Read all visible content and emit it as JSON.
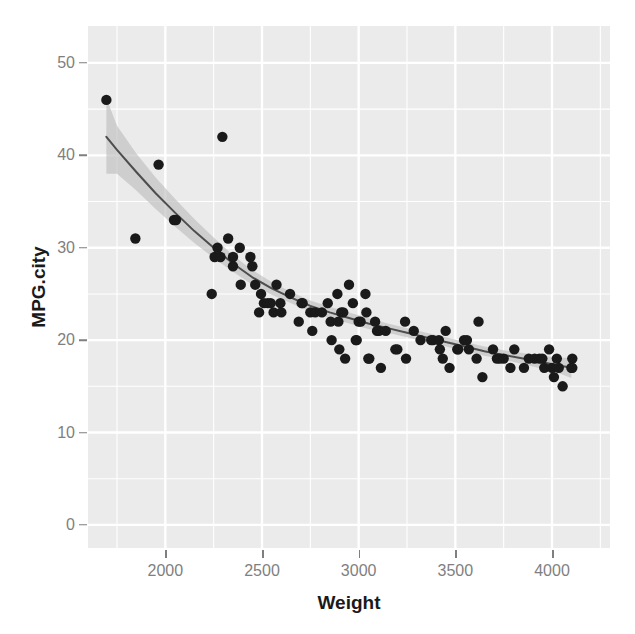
{
  "chart_data": {
    "type": "scatter",
    "title": "",
    "subtitle": "",
    "xlabel": "Weight",
    "ylabel": "MPG.city",
    "xlim": [
      1600,
      4300
    ],
    "ylim": [
      -2.5,
      54
    ],
    "grid": true,
    "legend": null,
    "xticks": [
      2000,
      2500,
      3000,
      3500,
      4000
    ],
    "xtick_labels": [
      "2000",
      "2500",
      "3000",
      "3500",
      "4000"
    ],
    "yticks": [
      0,
      10,
      20,
      30,
      40,
      50
    ],
    "ytick_labels": [
      "0",
      "10",
      "20",
      "30",
      "40",
      "50"
    ],
    "minor_xticks": [
      1750,
      2250,
      2750,
      3250,
      3750,
      4250
    ],
    "minor_yticks": [
      5,
      15,
      25,
      35,
      45
    ],
    "point_color": "#1a1a1a",
    "point_size": 5.2,
    "panel_background": "#ebebeb",
    "grid_color": "#ffffff",
    "smoother": {
      "name": "loess",
      "line_color": "#4d4d4d",
      "band_color": "#bfbfbf",
      "band_opacity": 0.65,
      "fit": [
        {
          "x": 1695,
          "y": 42.0,
          "lo": 38.0,
          "hi": 46.2
        },
        {
          "x": 1750,
          "y": 40.6,
          "lo": 38.0,
          "hi": 43.2
        },
        {
          "x": 1850,
          "y": 38.2,
          "lo": 36.2,
          "hi": 40.2
        },
        {
          "x": 1950,
          "y": 35.9,
          "lo": 34.2,
          "hi": 37.6
        },
        {
          "x": 2050,
          "y": 33.8,
          "lo": 32.3,
          "hi": 35.3
        },
        {
          "x": 2150,
          "y": 31.8,
          "lo": 30.5,
          "hi": 33.1
        },
        {
          "x": 2250,
          "y": 30.0,
          "lo": 28.9,
          "hi": 31.1
        },
        {
          "x": 2350,
          "y": 28.3,
          "lo": 27.4,
          "hi": 29.2
        },
        {
          "x": 2450,
          "y": 26.8,
          "lo": 26.0,
          "hi": 27.6
        },
        {
          "x": 2550,
          "y": 25.6,
          "lo": 24.9,
          "hi": 26.3
        },
        {
          "x": 2650,
          "y": 24.6,
          "lo": 24.0,
          "hi": 25.2
        },
        {
          "x": 2750,
          "y": 23.7,
          "lo": 23.1,
          "hi": 24.3
        },
        {
          "x": 2850,
          "y": 23.0,
          "lo": 22.4,
          "hi": 23.6
        },
        {
          "x": 2950,
          "y": 22.4,
          "lo": 21.8,
          "hi": 23.0
        },
        {
          "x": 3050,
          "y": 21.8,
          "lo": 21.2,
          "hi": 22.4
        },
        {
          "x": 3150,
          "y": 21.3,
          "lo": 20.8,
          "hi": 21.8
        },
        {
          "x": 3250,
          "y": 20.8,
          "lo": 20.3,
          "hi": 21.3
        },
        {
          "x": 3350,
          "y": 20.3,
          "lo": 19.8,
          "hi": 20.8
        },
        {
          "x": 3450,
          "y": 19.8,
          "lo": 19.3,
          "hi": 20.3
        },
        {
          "x": 3550,
          "y": 19.3,
          "lo": 18.8,
          "hi": 19.8
        },
        {
          "x": 3650,
          "y": 18.8,
          "lo": 18.3,
          "hi": 19.3
        },
        {
          "x": 3750,
          "y": 18.4,
          "lo": 17.9,
          "hi": 18.9
        },
        {
          "x": 3850,
          "y": 18.0,
          "lo": 17.4,
          "hi": 18.6
        },
        {
          "x": 3950,
          "y": 17.6,
          "lo": 16.9,
          "hi": 18.3
        },
        {
          "x": 4050,
          "y": 17.2,
          "lo": 16.3,
          "hi": 18.1
        },
        {
          "x": 4100,
          "y": 17.0,
          "lo": 15.9,
          "hi": 18.1
        }
      ]
    },
    "points": [
      {
        "x": 1695,
        "y": 46
      },
      {
        "x": 1845,
        "y": 31
      },
      {
        "x": 1965,
        "y": 39
      },
      {
        "x": 2045,
        "y": 33
      },
      {
        "x": 2055,
        "y": 33
      },
      {
        "x": 2240,
        "y": 25
      },
      {
        "x": 2255,
        "y": 29
      },
      {
        "x": 2270,
        "y": 30
      },
      {
        "x": 2285,
        "y": 29
      },
      {
        "x": 2295,
        "y": 42
      },
      {
        "x": 2325,
        "y": 31
      },
      {
        "x": 2350,
        "y": 29
      },
      {
        "x": 2350,
        "y": 28
      },
      {
        "x": 2385,
        "y": 30
      },
      {
        "x": 2390,
        "y": 26
      },
      {
        "x": 2440,
        "y": 29
      },
      {
        "x": 2450,
        "y": 28
      },
      {
        "x": 2465,
        "y": 26
      },
      {
        "x": 2485,
        "y": 23
      },
      {
        "x": 2495,
        "y": 25
      },
      {
        "x": 2510,
        "y": 24
      },
      {
        "x": 2530,
        "y": 24
      },
      {
        "x": 2545,
        "y": 24
      },
      {
        "x": 2560,
        "y": 23
      },
      {
        "x": 2575,
        "y": 26
      },
      {
        "x": 2595,
        "y": 24
      },
      {
        "x": 2600,
        "y": 23
      },
      {
        "x": 2645,
        "y": 25
      },
      {
        "x": 2690,
        "y": 22
      },
      {
        "x": 2705,
        "y": 24
      },
      {
        "x": 2710,
        "y": 24
      },
      {
        "x": 2750,
        "y": 23
      },
      {
        "x": 2760,
        "y": 21
      },
      {
        "x": 2775,
        "y": 23
      },
      {
        "x": 2810,
        "y": 23
      },
      {
        "x": 2840,
        "y": 24
      },
      {
        "x": 2855,
        "y": 22
      },
      {
        "x": 2860,
        "y": 20
      },
      {
        "x": 2890,
        "y": 25
      },
      {
        "x": 2895,
        "y": 22
      },
      {
        "x": 2900,
        "y": 19
      },
      {
        "x": 2910,
        "y": 23
      },
      {
        "x": 2920,
        "y": 23
      },
      {
        "x": 2930,
        "y": 18
      },
      {
        "x": 2950,
        "y": 26
      },
      {
        "x": 2970,
        "y": 24
      },
      {
        "x": 2985,
        "y": 20
      },
      {
        "x": 2990,
        "y": 20
      },
      {
        "x": 3000,
        "y": 22
      },
      {
        "x": 3010,
        "y": 22
      },
      {
        "x": 3035,
        "y": 25
      },
      {
        "x": 3040,
        "y": 23
      },
      {
        "x": 3050,
        "y": 18
      },
      {
        "x": 3055,
        "y": 18
      },
      {
        "x": 3085,
        "y": 22
      },
      {
        "x": 3095,
        "y": 21
      },
      {
        "x": 3105,
        "y": 21
      },
      {
        "x": 3115,
        "y": 17
      },
      {
        "x": 3140,
        "y": 21
      },
      {
        "x": 3190,
        "y": 19
      },
      {
        "x": 3200,
        "y": 19
      },
      {
        "x": 3240,
        "y": 22
      },
      {
        "x": 3245,
        "y": 18
      },
      {
        "x": 3285,
        "y": 21
      },
      {
        "x": 3320,
        "y": 20
      },
      {
        "x": 3375,
        "y": 20
      },
      {
        "x": 3385,
        "y": 20
      },
      {
        "x": 3415,
        "y": 20
      },
      {
        "x": 3420,
        "y": 19
      },
      {
        "x": 3435,
        "y": 18
      },
      {
        "x": 3450,
        "y": 21
      },
      {
        "x": 3470,
        "y": 17
      },
      {
        "x": 3510,
        "y": 19
      },
      {
        "x": 3515,
        "y": 19
      },
      {
        "x": 3545,
        "y": 20
      },
      {
        "x": 3560,
        "y": 20
      },
      {
        "x": 3570,
        "y": 19
      },
      {
        "x": 3610,
        "y": 18
      },
      {
        "x": 3620,
        "y": 22
      },
      {
        "x": 3640,
        "y": 16
      },
      {
        "x": 3695,
        "y": 19
      },
      {
        "x": 3715,
        "y": 18
      },
      {
        "x": 3730,
        "y": 18
      },
      {
        "x": 3750,
        "y": 18
      },
      {
        "x": 3785,
        "y": 17
      },
      {
        "x": 3805,
        "y": 19
      },
      {
        "x": 3855,
        "y": 17
      },
      {
        "x": 3880,
        "y": 18
      },
      {
        "x": 3910,
        "y": 18
      },
      {
        "x": 3935,
        "y": 18
      },
      {
        "x": 3950,
        "y": 18
      },
      {
        "x": 3960,
        "y": 17
      },
      {
        "x": 3985,
        "y": 19
      },
      {
        "x": 4000,
        "y": 17
      },
      {
        "x": 4010,
        "y": 16
      },
      {
        "x": 4025,
        "y": 18
      },
      {
        "x": 4035,
        "y": 17
      },
      {
        "x": 4055,
        "y": 15
      },
      {
        "x": 4100,
        "y": 17
      },
      {
        "x": 4105,
        "y": 18
      },
      {
        "x": 4105,
        "y": 17
      }
    ]
  }
}
